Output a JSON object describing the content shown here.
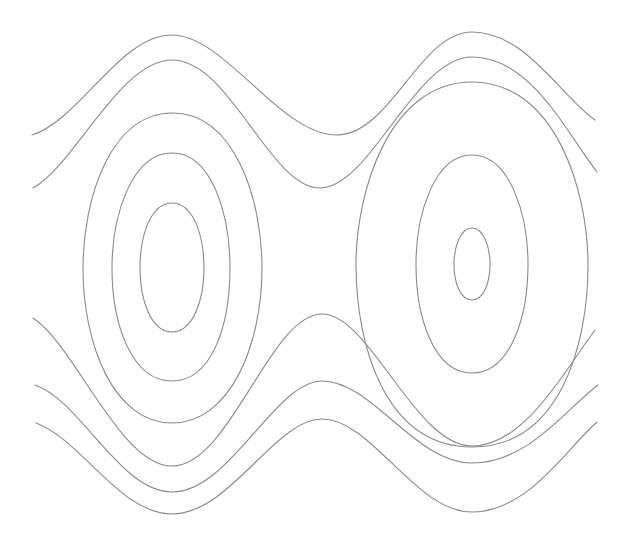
{
  "diagram": {
    "type": "contour-plot",
    "background": "#ffffff",
    "stroke_color": "#8a8a8a",
    "contours": [
      {
        "id": "top-wave-1",
        "kind": "open",
        "d": "M32,135 C80,120 120,35 172,35 C225,35 280,135 337,135 C390,135 420,32 472,32 C525,32 560,95 595,120"
      },
      {
        "id": "top-wave-2",
        "kind": "open",
        "d": "M33,188 C75,165 120,60 172,60 C230,60 270,188 320,188 C370,188 415,57 472,57 C530,57 565,130 597,172"
      },
      {
        "id": "left-oval-outer",
        "kind": "closed",
        "d": "M172,113 C235,113 262,200 262,268 C262,345 230,423 172,423 C114,423 83,345 83,268 C83,200 110,113 172,113 Z"
      },
      {
        "id": "left-oval-middle",
        "kind": "closed",
        "d": "M172,153 C212,153 230,215 230,268 C230,325 212,381 172,381 C132,381 112,325 112,268 C112,215 132,153 172,153 Z"
      },
      {
        "id": "left-oval-inner",
        "kind": "closed",
        "d": "M172,203 C193,203 204,235 204,268 C204,300 193,332 172,332 C151,332 140,300 140,268 C140,235 151,203 172,203 Z"
      },
      {
        "id": "right-oval-outer",
        "kind": "closed",
        "d": "M472,82 C555,82 588,190 588,265 C588,345 560,447 472,447 C385,447 356,345 356,265 C356,190 390,82 472,82 Z"
      },
      {
        "id": "right-oval-middle",
        "kind": "closed",
        "d": "M472,155 C510,155 528,215 528,264 C528,318 510,373 472,373 C434,373 416,318 416,264 C416,215 434,155 472,155 Z"
      },
      {
        "id": "right-oval-inner",
        "kind": "closed",
        "d": "M472,228 C484,228 490,248 490,264 C490,282 484,300 472,300 C460,300 454,282 454,264 C454,248 460,228 472,228 Z"
      },
      {
        "id": "bottom-wave-1",
        "kind": "open",
        "d": "M33,318 C75,345 120,466 172,466 C230,466 270,314 322,314 C370,314 415,446 472,446 C525,446 565,370 595,330"
      },
      {
        "id": "bottom-wave-2",
        "kind": "open",
        "d": "M35,385 C80,400 120,492 172,492 C230,492 275,381 322,381 C372,381 415,463 472,463 C528,463 565,410 598,385"
      },
      {
        "id": "bottom-wave-3",
        "kind": "open",
        "d": "M36,423 C82,440 120,514 172,514 C230,514 275,419 322,419 C372,419 415,512 472,512 C528,512 565,450 597,422"
      }
    ]
  }
}
